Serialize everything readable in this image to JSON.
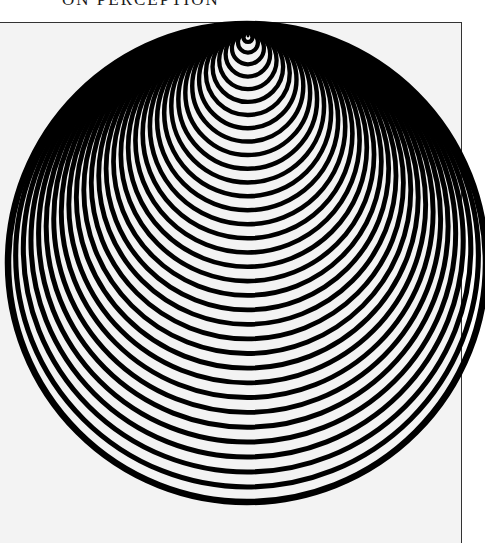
{
  "page": {
    "running_head": "ON PERCEPTION"
  },
  "figure": {
    "ring_color": "#000000",
    "background_color": "#f3f3f3",
    "apex": {
      "x": 248,
      "y": 34
    },
    "ring_count": 34,
    "innermost_radius": 3,
    "outermost_center": {
      "x": 247,
      "y": 262
    },
    "outermost_radius": 238,
    "bottom_first_y": 42,
    "bottom_last_y": 502,
    "stroke_width_inner": 4.2,
    "stroke_width_outer": 6.5
  }
}
